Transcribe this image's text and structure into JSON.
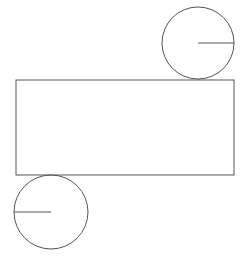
{
  "diagram": {
    "type": "cylinder-net",
    "stroke_color": "#555555",
    "background": "#ffffff",
    "top_circle": {
      "cx": 198,
      "cy": 43,
      "r": 36,
      "radius_line": {
        "x1": 198,
        "y1": 43,
        "x2": 234,
        "y2": 43
      }
    },
    "rectangle": {
      "x": 16,
      "y": 80,
      "width": 218,
      "height": 95
    },
    "bottom_circle": {
      "cx": 51,
      "cy": 212,
      "r": 37,
      "radius_line": {
        "x1": 14,
        "y1": 212,
        "x2": 51,
        "y2": 212
      }
    }
  }
}
